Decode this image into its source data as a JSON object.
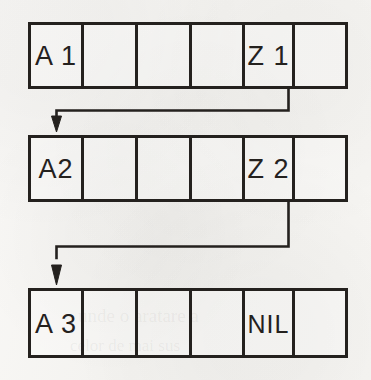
{
  "diagram": {
    "type": "linked-list",
    "background_color": "#f6f5f3",
    "ink_color": "#24211e",
    "ghost_text": {
      "line1": "unde o aratare a",
      "line2": "celor de mai sus"
    },
    "nodes": [
      {
        "id": "node-1",
        "cells": [
          {
            "label": "A 1",
            "filled": true
          },
          {
            "label": "",
            "filled": false
          },
          {
            "label": "",
            "filled": false
          },
          {
            "label": "",
            "filled": false
          },
          {
            "label": "Z 1",
            "filled": true
          },
          {
            "label": "",
            "filled": false
          }
        ]
      },
      {
        "id": "node-2",
        "cells": [
          {
            "label": "A2",
            "filled": true
          },
          {
            "label": "",
            "filled": false
          },
          {
            "label": "",
            "filled": false
          },
          {
            "label": "",
            "filled": false
          },
          {
            "label": "Z 2",
            "filled": true
          },
          {
            "label": "",
            "filled": false
          }
        ]
      },
      {
        "id": "node-3",
        "cells": [
          {
            "label": "A 3",
            "filled": true
          },
          {
            "label": "",
            "filled": false
          },
          {
            "label": "",
            "filled": false
          },
          {
            "label": "",
            "filled": false
          },
          {
            "label": "NIL",
            "filled": true
          },
          {
            "label": "",
            "filled": false
          }
        ]
      }
    ],
    "connectors": [
      {
        "id": "connector-1",
        "from": "node-1-pointer-cell",
        "to": "node-2-head",
        "style": "elbow-arrow"
      },
      {
        "id": "connector-2",
        "from": "node-2-pointer-cell",
        "to": "node-3-head",
        "style": "elbow-arrow"
      }
    ]
  }
}
